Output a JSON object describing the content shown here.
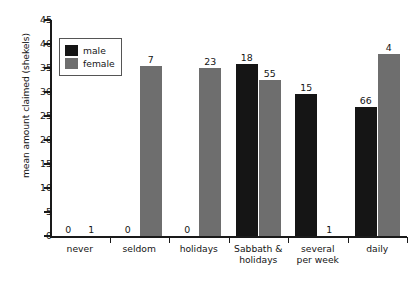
{
  "chart_data": {
    "type": "bar",
    "title": "",
    "subtitle": "",
    "xlabel": "",
    "ylabel": "mean amount claimed (shekels)",
    "ylim": [
      0,
      45
    ],
    "ytick_labels": [
      "0",
      "5",
      "10",
      "15",
      "20",
      "25",
      "30",
      "35",
      "40",
      "45"
    ],
    "ytick_values": [
      0,
      5,
      10,
      15,
      20,
      25,
      30,
      35,
      40,
      45
    ],
    "grid": false,
    "legend_position": "upper-left-inside",
    "categories": [
      "never",
      "seldom",
      "holidays",
      "Sabbath & holidays",
      "several per week",
      "daily"
    ],
    "category_lines": [
      [
        "never"
      ],
      [
        "seldom"
      ],
      [
        "holidays"
      ],
      [
        "Sabbath &",
        "holidays"
      ],
      [
        "several",
        "per week"
      ],
      [
        "daily"
      ]
    ],
    "series": [
      {
        "name": "male",
        "color": "#151515",
        "values": [
          0,
          0,
          0,
          35.8,
          29.6,
          26.8
        ],
        "point_labels": [
          "0",
          "0",
          "0",
          "18",
          "15",
          "66"
        ]
      },
      {
        "name": "female",
        "color": "#6e6e6e",
        "values": [
          0,
          35.4,
          35.1,
          32.6,
          0,
          37.9
        ],
        "point_labels": [
          "1",
          "7",
          "23",
          "55",
          "1",
          "4"
        ]
      }
    ]
  },
  "legend": {
    "entries": [
      {
        "label": "male",
        "swatch": "male"
      },
      {
        "label": "female",
        "swatch": "female"
      }
    ]
  }
}
